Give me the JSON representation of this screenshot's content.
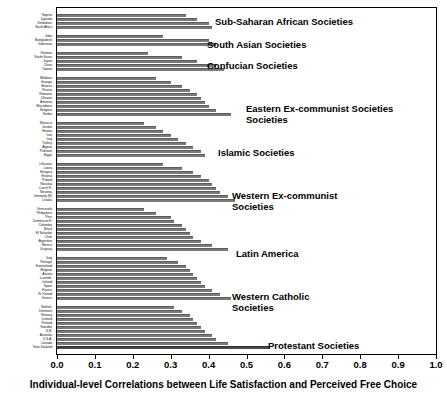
{
  "chart_data": {
    "type": "bar",
    "orientation": "horizontal",
    "title": "",
    "xlabel": "Individual-level Correlations between Life Satisfaction and Perceived Free Choice",
    "ylabel": "",
    "xlim": [
      0.0,
      1.0
    ],
    "xticks": [
      "0.0",
      "0.1",
      "0.2",
      "0.3",
      "0.4",
      "0.5",
      "0.6",
      "0.7",
      "0.8",
      "0.9",
      "1.0"
    ],
    "grid": false,
    "legend": null,
    "bar_color": "#7a7a7a",
    "highlight_color": "#4a4a4a",
    "groups": [
      {
        "label": "Sub-Saharan African Societies",
        "label_x": 215,
        "label_y": 16,
        "categories": [
          "Nigeria",
          "Uganda",
          "Zimbabwe",
          "South Africa"
        ],
        "values": [
          0.34,
          0.37,
          0.4,
          0.41
        ]
      },
      {
        "label": "South Asian Societies",
        "label_x": 207,
        "label_y": 39,
        "categories": [
          "India",
          "Bangladesh",
          "Indonesia"
        ],
        "values": [
          0.28,
          0.4,
          0.42
        ]
      },
      {
        "label": "Confucian Societies",
        "label_x": 207,
        "label_y": 60,
        "categories": [
          "Vietnam",
          "South Korea",
          "Japan",
          "China",
          "Taiwan"
        ],
        "values": [
          0.24,
          0.33,
          0.37,
          0.42,
          0.44
        ]
      },
      {
        "label": "Eastern Ex-communist Societies",
        "label_x": 246,
        "label_y": 103,
        "label_line2": "Societies",
        "categories": [
          "Moldova",
          "Georgia",
          "Belarus",
          "Russia",
          "Romania",
          "Ukraine",
          "Armenia",
          "Macedonia",
          "Bulgaria",
          "Serbia"
        ],
        "values": [
          0.26,
          0.3,
          0.33,
          0.35,
          0.37,
          0.38,
          0.39,
          0.4,
          0.42,
          0.46
        ]
      },
      {
        "label": "Islamic Societies",
        "label_x": 218,
        "label_y": 147,
        "categories": [
          "Morocco",
          "Jordan",
          "Bosnia",
          "Iran",
          "Iraq",
          "Turkey",
          "Algeria",
          "Pakistan",
          "Egypt"
        ],
        "values": [
          0.23,
          0.26,
          0.28,
          0.3,
          0.32,
          0.34,
          0.36,
          0.38,
          0.39
        ]
      },
      {
        "label": "Western Ex-communist",
        "label_x": 232,
        "label_y": 190,
        "label_line2": "Societies",
        "categories": [
          "Lithuania",
          "Latvia",
          "Hungary",
          "Estonia",
          "Poland",
          "Slovakia",
          "Czech R.",
          "Slovenia",
          "Germany (E)",
          "Croatia"
        ],
        "values": [
          0.28,
          0.33,
          0.36,
          0.38,
          0.4,
          0.41,
          0.42,
          0.43,
          0.45,
          0.47
        ]
      },
      {
        "label": "Latin America",
        "label_x": 236,
        "label_y": 248,
        "categories": [
          "Venezuela",
          "Philippines",
          "Peru",
          "Dominican R.",
          "Colombia",
          "Brazil",
          "El Salvador",
          "Chile",
          "Argentina",
          "Mexico",
          "Uruguay"
        ],
        "values": [
          0.23,
          0.26,
          0.3,
          0.31,
          0.33,
          0.34,
          0.35,
          0.36,
          0.38,
          0.41,
          0.45
        ]
      },
      {
        "label": "Western Catholic",
        "label_x": 232,
        "label_y": 291,
        "label_line2": "Societies",
        "categories": [
          "Italy",
          "Portugal",
          "Switzerland",
          "Belgium",
          "Austria",
          "Luxemb.",
          "Ireland",
          "Spain",
          "France",
          "N. Ireland",
          "Greece"
        ],
        "values": [
          0.29,
          0.32,
          0.34,
          0.35,
          0.36,
          0.37,
          0.38,
          0.39,
          0.41,
          0.43,
          0.46
        ]
      },
      {
        "label": "Protestant Societies",
        "label_x": 268,
        "label_y": 340,
        "categories": [
          "Netherl.",
          "Denmark",
          "Norway",
          "Iceland",
          "Finland",
          "Sweden",
          "G.B.",
          "Australia",
          "U.S.A.",
          "Canada",
          "New Zealand"
        ],
        "values": [
          0.31,
          0.33,
          0.35,
          0.36,
          0.37,
          0.38,
          0.39,
          0.41,
          0.42,
          0.45,
          0.56
        ]
      }
    ]
  }
}
